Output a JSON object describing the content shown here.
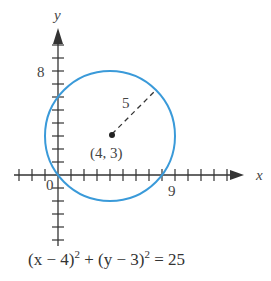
{
  "chart_data": {
    "type": "line",
    "title": "",
    "xlabel": "x",
    "ylabel": "y",
    "xlim": [
      -4,
      14
    ],
    "ylim": [
      -5,
      11
    ],
    "tick_labels": {
      "x": [
        "0",
        "9"
      ],
      "y": [
        "8"
      ]
    },
    "circle": {
      "center": [
        4,
        3
      ],
      "radius": 5,
      "color": "#3a9ad9"
    },
    "center_label": "(4, 3)",
    "radius_label": "5",
    "equation": {
      "lhs1": "(x − 4)",
      "exp1": "2",
      "plus": " + (y − 3)",
      "exp2": "2",
      "rhs": " = 25"
    }
  }
}
